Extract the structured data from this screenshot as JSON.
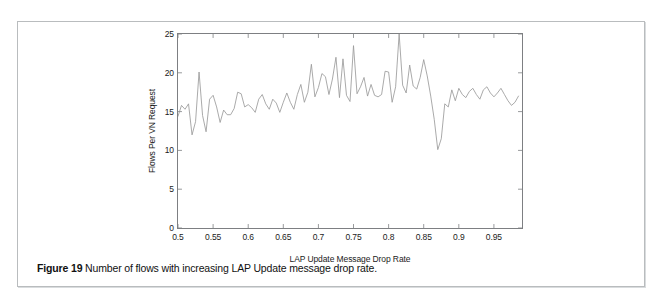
{
  "page": {
    "background_color": "#ffffff",
    "border_color": "#b9bcbe"
  },
  "caption": {
    "label": "Figure 19",
    "text": " Number of flows with increasing LAP Update message drop rate."
  },
  "chart_data": {
    "type": "line",
    "title": "",
    "xlabel": "LAP Update Message Drop Rate",
    "ylabel": "Flows Per VN Request",
    "xlim": [
      0.5,
      0.99
    ],
    "ylim": [
      0,
      25
    ],
    "grid": false,
    "legend": "none",
    "line_color": "#9a9a9a",
    "xticks": [
      0.5,
      0.55,
      0.6,
      0.65,
      0.7,
      0.75,
      0.8,
      0.85,
      0.9,
      0.95
    ],
    "xtick_labels": [
      "0.5",
      "0.55",
      "0.6",
      "0.65",
      "0.7",
      "0.75",
      "0.8",
      "0.85",
      "0.9",
      "0.95"
    ],
    "yticks": [
      0,
      5,
      10,
      15,
      20,
      25
    ],
    "ytick_labels": [
      "0",
      "5",
      "10",
      "15",
      "20",
      "25"
    ],
    "x": [
      0.5,
      0.505,
      0.51,
      0.515,
      0.52,
      0.525,
      0.53,
      0.535,
      0.54,
      0.545,
      0.55,
      0.555,
      0.56,
      0.565,
      0.57,
      0.575,
      0.58,
      0.585,
      0.59,
      0.595,
      0.6,
      0.605,
      0.61,
      0.615,
      0.62,
      0.625,
      0.63,
      0.635,
      0.64,
      0.645,
      0.65,
      0.655,
      0.66,
      0.665,
      0.67,
      0.675,
      0.68,
      0.685,
      0.69,
      0.695,
      0.7,
      0.705,
      0.71,
      0.715,
      0.72,
      0.725,
      0.73,
      0.735,
      0.74,
      0.745,
      0.75,
      0.755,
      0.76,
      0.765,
      0.77,
      0.775,
      0.78,
      0.785,
      0.79,
      0.795,
      0.8,
      0.805,
      0.81,
      0.815,
      0.82,
      0.825,
      0.83,
      0.835,
      0.84,
      0.845,
      0.85,
      0.855,
      0.86,
      0.865,
      0.87,
      0.875,
      0.88,
      0.885,
      0.89,
      0.895,
      0.9,
      0.905,
      0.91,
      0.915,
      0.92,
      0.925,
      0.93,
      0.935,
      0.94,
      0.945,
      0.95,
      0.955,
      0.96,
      0.965,
      0.97,
      0.975,
      0.98,
      0.985
    ],
    "values": [
      14.4,
      15.8,
      15.3,
      16.0,
      12.0,
      13.7,
      20.1,
      14.5,
      12.4,
      16.6,
      17.1,
      15.6,
      13.6,
      15.2,
      14.6,
      14.6,
      15.4,
      17.5,
      17.3,
      15.6,
      15.9,
      15.5,
      14.9,
      16.6,
      17.2,
      16.0,
      15.3,
      16.6,
      16.1,
      14.9,
      16.2,
      17.4,
      16.2,
      15.3,
      17.2,
      18.5,
      16.2,
      17.5,
      21.1,
      16.9,
      18.1,
      19.9,
      19.5,
      17.2,
      19.2,
      22.0,
      16.8,
      21.8,
      17.1,
      16.3,
      23.5,
      17.3,
      18.2,
      19.4,
      17.0,
      18.5,
      17.1,
      16.9,
      17.2,
      20.2,
      20.1,
      16.2,
      18.2,
      25.0,
      18.4,
      17.4,
      21.0,
      18.3,
      17.9,
      19.4,
      21.7,
      19.6,
      17.0,
      14.0,
      10.1,
      11.5,
      16.0,
      15.6,
      17.8,
      16.4,
      18.0,
      17.2,
      16.8,
      17.6,
      18.0,
      17.2,
      16.6,
      17.8,
      18.2,
      17.4,
      16.9,
      17.4,
      18.0,
      17.2,
      16.4,
      15.8,
      16.2,
      17.0
    ]
  }
}
